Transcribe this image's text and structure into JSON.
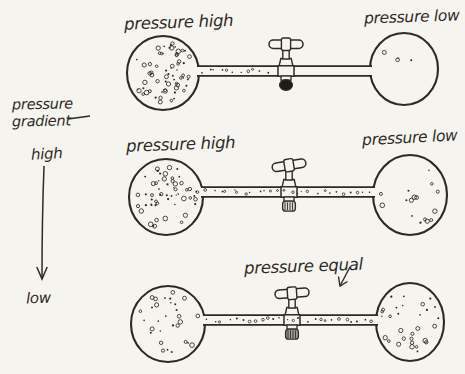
{
  "colors": {
    "paper": "#f6f4ee",
    "ink": "#2d2a26",
    "plug_closed": "#1e1c19",
    "plug_open_light": "#ddd8cc",
    "plug_open_dark": "#a39e92"
  },
  "legend": {
    "line1": "pressure",
    "line2": "gradient",
    "high": "high",
    "low": "low"
  },
  "rows": [
    {
      "left_label": "pressure high",
      "right_label": "pressure low",
      "valve_state": "closed",
      "left_gas": "dense",
      "right_gas": "nearly-empty",
      "left_dots": 64,
      "right_dots": 4,
      "tube_gas": "left-of-valve-only"
    },
    {
      "left_label": "pressure high",
      "right_label": "pressure low",
      "valve_state": "open",
      "left_gas": "dense",
      "right_gas": "sparse",
      "left_dots": 56,
      "right_dots": 16,
      "tube_gas": "throughout"
    },
    {
      "center_label": "pressure equal",
      "valve_state": "open",
      "left_gas": "medium",
      "right_gas": "medium",
      "left_dots": 30,
      "right_dots": 30,
      "tube_gas": "throughout"
    }
  ]
}
